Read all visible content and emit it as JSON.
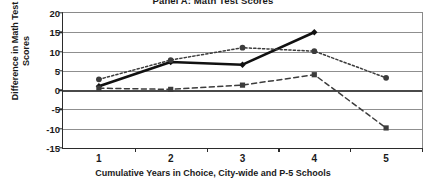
{
  "chart_data": {
    "type": "line",
    "title": "Panel A: Math Test Scores",
    "xlabel": "Cumulative Years in Choice, City-wide and P-5 Schools",
    "ylabel": "Difference in Math Test Scores",
    "categories": [
      "1",
      "2",
      "3",
      "4",
      "5"
    ],
    "x": [
      1,
      2,
      3,
      4,
      5
    ],
    "ylim": [
      -15,
      20
    ],
    "yticks": [
      20,
      15,
      10,
      5,
      0,
      -5,
      -10,
      -15
    ],
    "ytick_labels": [
      "20",
      "15",
      "10",
      "5",
      "0",
      "-5",
      "-10",
      "-15"
    ],
    "grid": true,
    "legend": "none",
    "series": [
      {
        "name": "solid-series",
        "style": "solid",
        "marker": "diamond",
        "color": "#111111",
        "x": [
          1,
          2,
          3,
          4
        ],
        "values": [
          1.0,
          7.3,
          6.6,
          15.0
        ]
      },
      {
        "name": "dotted-series",
        "style": "dotted",
        "marker": "circle",
        "color": "#3c3c3c",
        "x": [
          1,
          2,
          3,
          4,
          5
        ],
        "values": [
          2.8,
          7.8,
          11.0,
          10.1,
          3.2
        ]
      },
      {
        "name": "dashed-series",
        "style": "dashed",
        "marker": "square",
        "color": "#3c3c3c",
        "x": [
          1,
          2,
          3,
          4,
          5
        ],
        "values": [
          0.5,
          0.2,
          1.3,
          4.0,
          -9.8
        ]
      }
    ]
  }
}
